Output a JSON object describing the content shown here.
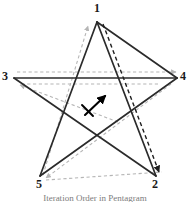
{
  "figure": {
    "width": 190,
    "height": 202,
    "background": "#ffffff"
  },
  "colors": {
    "solid_stroke": "#2b2b2b",
    "dashed_black_stroke": "#1f1f1f",
    "dashed_gray_stroke": "#b5b5b5",
    "center_arrow": "#000000",
    "label_text": "#1a1a1a",
    "caption_text": "#7c7c7c"
  },
  "vertices": [
    {
      "id": "1",
      "label": "1",
      "x": 97,
      "y": 22,
      "label_x": 94,
      "label_y": 2
    },
    {
      "id": "2",
      "label": "2",
      "x": 156,
      "y": 176,
      "label_x": 152,
      "label_y": 178
    },
    {
      "id": "3",
      "label": "3",
      "x": 14,
      "y": 78,
      "label_x": 2,
      "label_y": 70
    },
    {
      "id": "4",
      "label": "4",
      "x": 177,
      "y": 78,
      "label_x": 180,
      "label_y": 70
    },
    {
      "id": "5",
      "label": "5",
      "x": 40,
      "y": 176,
      "label_x": 36,
      "label_y": 178
    }
  ],
  "star_edges": [
    {
      "name": "edge-1-to-4",
      "from": "1",
      "to": "4",
      "style": "solid"
    },
    {
      "name": "edge-4-to-5",
      "from": "4",
      "to": "5",
      "style": "solid"
    },
    {
      "name": "edge-5-to-1",
      "from": "5",
      "to": "1",
      "style": "solid"
    },
    {
      "name": "edge-1-to-2",
      "from": "1",
      "to": "2",
      "style": "solid"
    },
    {
      "name": "edge-2-to-3",
      "from": "2",
      "to": "3",
      "style": "solid"
    },
    {
      "name": "edge-3-to-4",
      "from": "3",
      "to": "4",
      "style": "solid"
    }
  ],
  "dashed_black_path": {
    "name": "black-dashed-traversal",
    "description": "dashed black path from vertex 1 down to vertex 2 with arrowhead at 2",
    "arrow_at": "2",
    "style": "dashed"
  },
  "dashed_gray_paths": [
    {
      "name": "gray-dashed-to-1",
      "description": "gray dashed path rising to vertex 1, arrowhead pointing up-right at 1",
      "arrow_at": "1",
      "style": "dashed"
    },
    {
      "name": "gray-dashed-to-4",
      "description": "gray dashed horizontal path left to right, arrowhead at 4",
      "arrow_at": "4",
      "style": "dashed"
    },
    {
      "name": "gray-dashed-to-3",
      "description": "gray dashed path rising to vertex 3, arrowhead pointing up-left at 3",
      "arrow_at": "3",
      "style": "dashed"
    },
    {
      "name": "gray-dashed-to-5",
      "description": "gray dashed path descending to vertex 5, arrowhead pointing down-left at 5",
      "arrow_at": "5",
      "style": "dashed"
    }
  ],
  "center_arrow": {
    "name": "center-direction-arrow",
    "description": "short diagonal arrow in the star interior pointing up-right with tail crossbar",
    "x1": 85,
    "y1": 115,
    "x2": 106,
    "y2": 95
  },
  "caption": {
    "text": "Iteration Order in Pentagram"
  }
}
